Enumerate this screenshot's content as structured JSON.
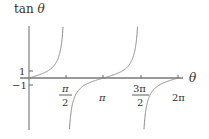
{
  "chart_data": {
    "type": "line",
    "title": "",
    "ylabel": "tan θ",
    "xlabel": "θ",
    "x_ticks": [
      {
        "label": "π/2",
        "num": "π",
        "den": "2",
        "value": 1.5708
      },
      {
        "label": "π",
        "value": 3.1416
      },
      {
        "label": "3π/2",
        "num": "3π",
        "den": "2",
        "value": 4.7124
      },
      {
        "label": "2π",
        "value": 6.2832
      }
    ],
    "y_ticks": [
      {
        "label": "1",
        "value": 1
      },
      {
        "label": "−1",
        "value": -1
      }
    ],
    "xlim": [
      0,
      6.2832
    ],
    "ylim": [
      -6,
      6
    ],
    "asymptotes": [
      1.5708,
      4.7124
    ],
    "series": [
      {
        "name": "tan θ",
        "function": "tan(theta)",
        "color": "#888888"
      }
    ],
    "grid": false,
    "legend": null
  },
  "labels": {
    "y_axis": "tan θ",
    "x_axis": "θ",
    "tick_pi_half_num": "π",
    "tick_pi_half_den": "2",
    "tick_pi": "π",
    "tick_3pi_half_num": "3π",
    "tick_3pi_half_den": "2",
    "tick_2pi": "2π",
    "tick_y_pos1": "1",
    "tick_y_neg1": "−1"
  },
  "colors": {
    "axis": "#666666",
    "curve": "#888888",
    "text": "#333333"
  }
}
